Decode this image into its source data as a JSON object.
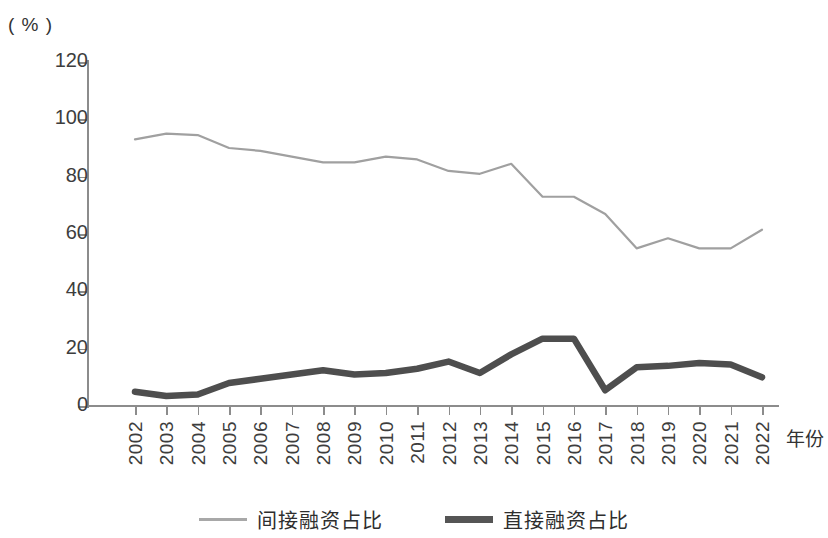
{
  "axis": {
    "unit_label": "( % )",
    "x_title": "年份",
    "y_ticks": [
      0,
      20,
      40,
      60,
      80,
      100,
      120
    ],
    "x_ticks": [
      "2002",
      "2003",
      "2004",
      "2005",
      "2006",
      "2007",
      "2008",
      "2009",
      "2010",
      "2011",
      "2012",
      "2013",
      "2014",
      "2015",
      "2016",
      "2017",
      "2018",
      "2019",
      "2020",
      "2021",
      "2022"
    ]
  },
  "legend": {
    "items": [
      {
        "label": "间接融资占比",
        "color": "#a8a8a8",
        "style": "thin"
      },
      {
        "label": "直接融资占比",
        "color": "#555555",
        "style": "thick"
      }
    ]
  },
  "chart_data": {
    "type": "line",
    "title": "",
    "subtitle": "",
    "xlabel": "年份",
    "ylabel": "( % )",
    "ylim": [
      0,
      120
    ],
    "ytick_step": 20,
    "grid": false,
    "legend_position": "bottom",
    "categories": [
      "2002",
      "2003",
      "2004",
      "2005",
      "2006",
      "2007",
      "2008",
      "2009",
      "2010",
      "2011",
      "2012",
      "2013",
      "2014",
      "2015",
      "2016",
      "2017",
      "2018",
      "2019",
      "2020",
      "2021",
      "2022"
    ],
    "series": [
      {
        "name": "间接融资占比",
        "color": "#a0a0a0",
        "line_width": 2.2,
        "values": [
          93,
          95,
          94.5,
          90,
          89,
          87,
          85,
          85,
          87,
          86,
          82,
          81,
          84.5,
          73,
          73,
          67,
          55,
          58.5,
          55,
          55,
          61.5
        ]
      },
      {
        "name": "直接融资占比",
        "color": "#4e4e4e",
        "line_width": 6.5,
        "values": [
          5,
          3.5,
          4,
          8,
          9.5,
          11,
          12.5,
          11,
          11.5,
          13,
          15.5,
          11.5,
          18,
          23.5,
          23.5,
          5.5,
          13.5,
          14,
          15,
          14.5,
          10
        ]
      }
    ]
  }
}
